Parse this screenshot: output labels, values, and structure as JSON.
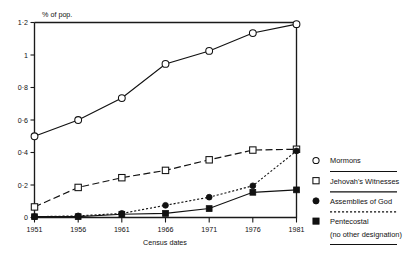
{
  "chart_data": {
    "type": "line",
    "title": "",
    "subtitle": "",
    "xlabel": "Census dates",
    "ylabel": "% of pop.",
    "categories": [
      "1951",
      "1956",
      "1961",
      "1966",
      "1971",
      "1976",
      "1981"
    ],
    "x": [
      1951,
      1956,
      1961,
      1966,
      1971,
      1976,
      1981
    ],
    "xlim": [
      1951,
      1981
    ],
    "ylim": [
      0,
      1.2
    ],
    "yticks": [
      0,
      0.2,
      0.4,
      0.6,
      0.8,
      1,
      1.2
    ],
    "ytick_labels": [
      "0",
      "0·2",
      "0·4",
      "0·6",
      "0·8",
      "1",
      "1·2"
    ],
    "grid": false,
    "legend_position": "right",
    "series": [
      {
        "name": "Mormons",
        "marker": "open-circle",
        "line_style": "solid",
        "values": [
          0.5,
          0.6,
          0.735,
          0.945,
          1.025,
          1.135,
          1.19
        ]
      },
      {
        "name": "Jehovah's Witnesses",
        "marker": "open-square",
        "line_style": "long-dash",
        "values": [
          0.065,
          0.185,
          0.245,
          0.29,
          0.355,
          0.415,
          0.42
        ]
      },
      {
        "name": "Assemblies of God",
        "marker": "filled-circle",
        "line_style": "dotted",
        "values": [
          0.005,
          0.01,
          0.025,
          0.075,
          0.125,
          0.195,
          0.41
        ]
      },
      {
        "name": "Pentecostal",
        "marker": "filled-square",
        "line_style": "solid",
        "values": [
          0.005,
          0.005,
          0.02,
          0.025,
          0.055,
          0.155,
          0.17
        ]
      }
    ]
  },
  "axes": {
    "y_axis_caption": "% of pop.",
    "x_axis_caption": "Census dates",
    "x_tick_labels": [
      "1951",
      "1956",
      "1961",
      "1966",
      "1971",
      "1976",
      "1981"
    ],
    "y_tick_labels": [
      "0",
      "0·2",
      "0·4",
      "0·6",
      "0·8",
      "1",
      "1·2"
    ]
  },
  "legend": {
    "entries": [
      {
        "marker": "open-circle",
        "label": "Mormons"
      },
      {
        "marker": "open-square",
        "label": "Jehovah's Witnesses"
      },
      {
        "marker": "filled-circle",
        "label": "Assemblies of God"
      },
      {
        "marker": "filled-square",
        "label": "Pentecostal"
      }
    ],
    "note": "(no other designation)"
  },
  "colors": {
    "ink": "#111111",
    "background": "#ffffff"
  }
}
